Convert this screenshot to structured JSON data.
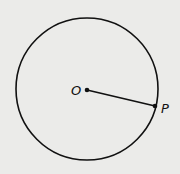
{
  "diagram": {
    "type": "geometry-circle",
    "circle": {
      "cx": 87,
      "cy": 89,
      "r": 71
    },
    "points": [
      {
        "label": "O",
        "x": 87,
        "y": 90,
        "role": "center"
      },
      {
        "label": "P",
        "x": 155,
        "y": 106,
        "role": "point-on-circle"
      }
    ],
    "segments": [
      {
        "from": "O",
        "to": "P",
        "name": "radius"
      }
    ],
    "colors": {
      "background": "#ebebe9",
      "stroke": "#111111"
    }
  }
}
